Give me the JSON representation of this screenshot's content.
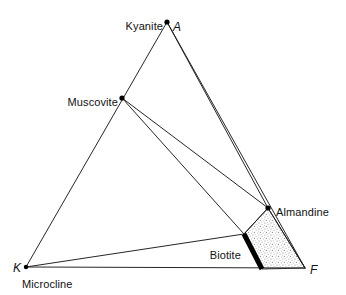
{
  "figure": {
    "type": "akf-ternary-phase-diagram",
    "title": "",
    "width": 346,
    "height": 295,
    "background_color": "#ffffff",
    "line_color": "#1a1a1a",
    "stipple_color": "#9a9a9a",
    "bar_color": "#000000"
  },
  "vertices": [
    {
      "id": "A",
      "label": "A",
      "mineral_label": "Kyanite",
      "x": 167,
      "y": 22
    },
    {
      "id": "K",
      "label": "K",
      "mineral_label": "Microcline",
      "x": 26,
      "y": 267
    },
    {
      "id": "F",
      "label": "F",
      "mineral_label": "",
      "x": 305,
      "y": 268
    }
  ],
  "phase_points": [
    {
      "id": "kyanite",
      "label": "Kyanite",
      "x": 167,
      "y": 22,
      "label_x": 163,
      "label_y": 21,
      "align": "right"
    },
    {
      "id": "muscovite",
      "label": "Muscovite",
      "x": 122,
      "y": 98,
      "label_x": 118,
      "label_y": 97,
      "align": "right"
    },
    {
      "id": "almandine",
      "label": "Almandine",
      "x": 268,
      "y": 208,
      "label_x": 276,
      "label_y": 207,
      "align": "left"
    },
    {
      "id": "microcline",
      "label": "Microcline",
      "x": 26,
      "y": 267,
      "label_x": 22,
      "label_y": 279,
      "align": "left"
    },
    {
      "id": "biotite",
      "label": "Biotite",
      "x": 244,
      "y": 234,
      "label_x": 241,
      "label_y": 250,
      "align": "right"
    }
  ],
  "vertex_labels": [
    {
      "id": "label-A",
      "text": "A",
      "x": 173,
      "y": 21,
      "align": "left"
    },
    {
      "id": "label-K",
      "text": "K",
      "x": 13,
      "y": 262,
      "align": "left"
    },
    {
      "id": "label-F",
      "text": "F",
      "x": 310,
      "y": 264,
      "align": "left"
    }
  ],
  "solid_solution_bar": {
    "name": "biotite-solid-solution",
    "x1": 244,
    "y1": 234,
    "x2": 262,
    "y2": 269,
    "width": 5,
    "color": "#000000"
  },
  "stippled_field": {
    "name": "almandine-biotite-f-field",
    "points": "268,208 244,234 262,269 305,268",
    "fill": "stipple"
  },
  "tie_lines": [
    {
      "name": "A-K-edge",
      "x1": 167,
      "y1": 22,
      "x2": 26,
      "y2": 267
    },
    {
      "name": "K-F-baseline",
      "x1": 26,
      "y1": 267,
      "x2": 305,
      "y2": 268
    },
    {
      "name": "A-almandine",
      "x1": 167,
      "y1": 22,
      "x2": 268,
      "y2": 208
    },
    {
      "name": "A-F-edge",
      "x1": 167,
      "y1": 22,
      "x2": 305,
      "y2": 268
    },
    {
      "name": "muscovite-almandine",
      "x1": 122,
      "y1": 98,
      "x2": 268,
      "y2": 208
    },
    {
      "name": "muscovite-biotite",
      "x1": 122,
      "y1": 98,
      "x2": 244,
      "y2": 234
    },
    {
      "name": "microcline-biotite",
      "x1": 26,
      "y1": 267,
      "x2": 244,
      "y2": 234
    },
    {
      "name": "almandine-biotite",
      "x1": 268,
      "y1": 208,
      "x2": 244,
      "y2": 234
    },
    {
      "name": "almandine-F",
      "x1": 268,
      "y1": 208,
      "x2": 305,
      "y2": 268
    }
  ]
}
